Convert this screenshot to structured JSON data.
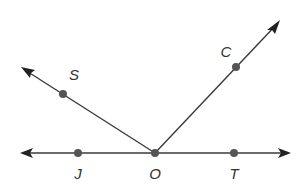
{
  "diagram": {
    "type": "geometry-angles",
    "vertex": "O",
    "line": {
      "name": "line JT",
      "through": [
        "J",
        "O",
        "T"
      ],
      "left_arrow": {
        "x": 20,
        "y": 153
      },
      "right_arrow": {
        "x": 291,
        "y": 153
      }
    },
    "rays": [
      {
        "name": "ray OS",
        "from": "O",
        "through": "S",
        "arrow": {
          "x": 21,
          "y": 67
        }
      },
      {
        "name": "ray OC",
        "from": "O",
        "through": "C",
        "arrow": {
          "x": 280,
          "y": 20
        }
      }
    ],
    "points": [
      {
        "id": "S",
        "label": "S",
        "x": 63,
        "y": 94,
        "label_x": 74,
        "label_y": 80
      },
      {
        "id": "C",
        "label": "C",
        "x": 236,
        "y": 67,
        "label_x": 226,
        "label_y": 57
      },
      {
        "id": "J",
        "label": "J",
        "x": 78,
        "y": 153,
        "label_x": 78,
        "label_y": 179
      },
      {
        "id": "O",
        "label": "O",
        "x": 155,
        "y": 153,
        "label_x": 155,
        "label_y": 179
      },
      {
        "id": "T",
        "label": "T",
        "x": 234,
        "y": 153,
        "label_x": 234,
        "label_y": 179
      }
    ],
    "colors": {
      "line": "#3a3a3a",
      "point": "#555555",
      "label": "#333333",
      "background": "#ffffff"
    }
  }
}
